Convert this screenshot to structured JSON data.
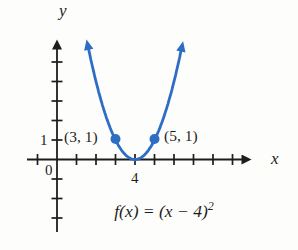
{
  "chart_data": {
    "type": "line",
    "function": "f(x) = (x - 4)^2",
    "vertex": {
      "x": 4,
      "y": 0
    },
    "marked_points": [
      {
        "x": 3,
        "y": 1,
        "label": "(3, 1)"
      },
      {
        "x": 5,
        "y": 1,
        "label": "(5, 1)"
      }
    ],
    "x_ticks": [
      -1,
      1,
      2,
      3,
      4,
      5,
      6,
      7,
      8,
      9
    ],
    "y_ticks": [
      -3,
      -2,
      -1,
      1,
      2,
      3,
      4,
      5
    ],
    "x_tick_labels": {
      "4": "4"
    },
    "y_tick_labels": {
      "1": "1"
    },
    "axis_labels": {
      "x": "x",
      "y": "y",
      "origin": "0"
    },
    "formula_display": {
      "main": "f(x) = (x − 4)",
      "sup": "2"
    },
    "curve_x_range": [
      1.61,
      6.39
    ],
    "grid": false,
    "legend": false,
    "colors": {
      "curve": "#2d6ec4",
      "axis": "#1d1d1d",
      "text": "#1d1d1d"
    },
    "layout": {
      "origin_px": [
        57,
        159.5
      ],
      "unit_px": 19.5
    }
  }
}
